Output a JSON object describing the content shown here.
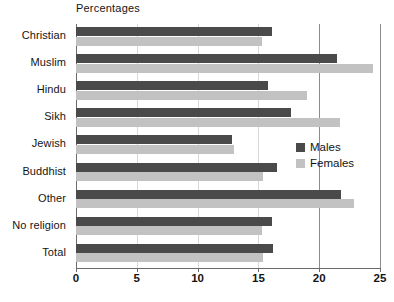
{
  "chart_data": {
    "type": "bar",
    "orientation": "horizontal",
    "title": "Percentages",
    "xlabel": "",
    "ylabel": "",
    "xlim": [
      0,
      25
    ],
    "xticks": [
      0,
      5,
      10,
      15,
      20,
      25
    ],
    "xtick_labels": [
      "0",
      "5",
      "10",
      "15",
      "20",
      "25"
    ],
    "grid": "vertical",
    "legend_position": "right-middle",
    "categories": [
      "Christian",
      "Muslim",
      "Hindu",
      "Sikh",
      "Jewish",
      "Buddhist",
      "Other",
      "No religion",
      "Total"
    ],
    "series": [
      {
        "name": "Males",
        "color": "#4a4a4a",
        "values": [
          16.1,
          21.5,
          15.8,
          17.7,
          12.8,
          16.5,
          21.8,
          16.1,
          16.2
        ]
      },
      {
        "name": "Females",
        "color": "#c2c2c2",
        "values": [
          15.3,
          24.4,
          19.0,
          21.7,
          13.0,
          15.4,
          22.9,
          15.3,
          15.4
        ]
      }
    ]
  },
  "legend": {
    "items": [
      {
        "label": "Males",
        "swatch": "males-swatch"
      },
      {
        "label": "Females",
        "swatch": "females-swatch"
      }
    ]
  }
}
